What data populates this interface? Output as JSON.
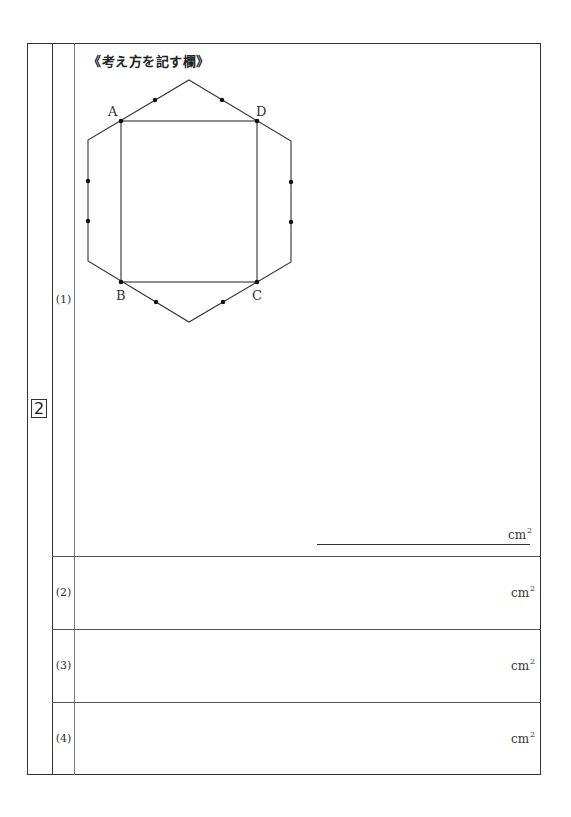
{
  "problem": {
    "number": "2",
    "heading": "《考え方を記す欄》"
  },
  "figure": {
    "labels": {
      "A": "A",
      "B": "B",
      "C": "C",
      "D": "D"
    },
    "shape": "hexagon with inscribed rectangle ABCD; dots mark trisection points on edges"
  },
  "rows": [
    {
      "label": "(1)",
      "unit": "cm",
      "unit_exp": "2"
    },
    {
      "label": "(2)",
      "unit": "cm",
      "unit_exp": "2"
    },
    {
      "label": "(3)",
      "unit": "cm",
      "unit_exp": "2"
    },
    {
      "label": "(4)",
      "unit": "cm",
      "unit_exp": "2"
    }
  ],
  "colors": {
    "line": "#333333",
    "background": "#ffffff"
  }
}
